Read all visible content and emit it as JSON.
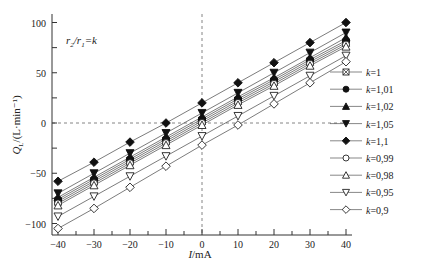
{
  "chart_data": {
    "type": "line",
    "title": "",
    "annotation": "r2/r1=k",
    "xlabel": "I/mA",
    "ylabel": "QL/(L·min⁻¹)",
    "xlim": [
      -42,
      42
    ],
    "ylim": [
      -110,
      110
    ],
    "xticks": [
      -40,
      -30,
      -20,
      -10,
      0,
      10,
      20,
      30,
      40
    ],
    "yticks": [
      -100,
      -50,
      0,
      50,
      100
    ],
    "grid": false,
    "zero_lines": true,
    "legend_position": "right",
    "x": [
      -40,
      -30,
      -20,
      -10,
      0,
      10,
      20,
      30,
      40
    ],
    "series": [
      {
        "name": "k=1",
        "marker": "square-x",
        "values": [
          -78,
          -58,
          -38,
          -18,
          2,
          22,
          41,
          61,
          80
        ]
      },
      {
        "name": "k=1.01",
        "marker": "circle-filled",
        "values": [
          -76,
          -56,
          -36,
          -16,
          4,
          24,
          43,
          63,
          82
        ]
      },
      {
        "name": "k=1.02",
        "marker": "triangle-filled",
        "values": [
          -74,
          -54,
          -34,
          -14,
          6,
          26,
          45,
          65,
          85
        ]
      },
      {
        "name": "k=1.05",
        "marker": "triangle-down-filled",
        "values": [
          -70,
          -50,
          -30,
          -10,
          10,
          30,
          50,
          70,
          90
        ]
      },
      {
        "name": "k=1.1",
        "marker": "diamond-filled",
        "values": [
          -58,
          -39,
          -19,
          0,
          20,
          40,
          60,
          80,
          100
        ]
      },
      {
        "name": "k=0.99",
        "marker": "circle-open",
        "values": [
          -80,
          -60,
          -40,
          -20,
          0,
          20,
          39,
          59,
          78
        ]
      },
      {
        "name": "k=0.98",
        "marker": "triangle-open",
        "values": [
          -82,
          -62,
          -42,
          -22,
          -2,
          18,
          37,
          57,
          76
        ]
      },
      {
        "name": "k=0.95",
        "marker": "triangle-down-open",
        "values": [
          -93,
          -73,
          -53,
          -33,
          -13,
          7,
          27,
          47,
          67
        ]
      },
      {
        "name": "k=0.9",
        "marker": "diamond-open",
        "values": [
          -105,
          -85,
          -64,
          -43,
          -22,
          -2,
          19,
          40,
          61
        ]
      }
    ]
  }
}
